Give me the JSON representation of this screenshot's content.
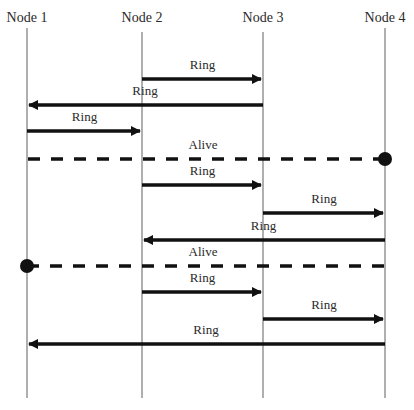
{
  "diagram": {
    "type": "sequence",
    "nodes": [
      {
        "id": "n1",
        "label": "Node 1",
        "x": 27,
        "top": 28
      },
      {
        "id": "n2",
        "label": "Node 2",
        "x": 142,
        "top": 32
      },
      {
        "id": "n3",
        "label": "Node 3",
        "x": 263,
        "top": 32
      },
      {
        "id": "n4",
        "label": "Node 4",
        "x": 385,
        "top": 28
      }
    ],
    "lifeline_bottom": 398,
    "messages": [
      {
        "label": "Ring",
        "from": "n2",
        "to": "n3",
        "y": 79,
        "style": "solid"
      },
      {
        "label": "Ring",
        "from": "n3",
        "to": "n1",
        "y": 105,
        "style": "solid"
      },
      {
        "label": "Ring",
        "from": "n1",
        "to": "n2",
        "y": 131,
        "style": "solid"
      },
      {
        "label": "Alive",
        "from": "n4",
        "to": "n1",
        "y": 159,
        "style": "dashed",
        "origin_dot": "n4",
        "label_x": 203
      },
      {
        "label": "Ring",
        "from": "n2",
        "to": "n3",
        "y": 185,
        "style": "solid"
      },
      {
        "label": "Ring",
        "from": "n3",
        "to": "n4",
        "y": 213,
        "style": "solid"
      },
      {
        "label": "Ring",
        "from": "n4",
        "to": "n2",
        "y": 240,
        "style": "solid"
      },
      {
        "label": "Alive",
        "from": "n1",
        "to": "n4",
        "y": 266,
        "style": "dashed",
        "origin_dot": "n1",
        "label_x": 203
      },
      {
        "label": "Ring",
        "from": "n2",
        "to": "n3",
        "y": 292,
        "style": "solid"
      },
      {
        "label": "Ring",
        "from": "n3",
        "to": "n4",
        "y": 319,
        "style": "solid"
      },
      {
        "label": "Ring",
        "from": "n4",
        "to": "n1",
        "y": 344,
        "style": "solid"
      }
    ],
    "colors": {
      "lifeline": "#7a7a7a",
      "arrow": "#111111",
      "text": "#2a2a2a",
      "background": "#ffffff"
    }
  }
}
